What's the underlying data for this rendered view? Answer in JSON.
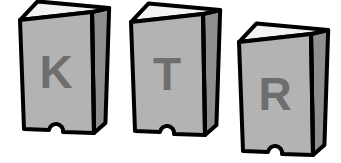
{
  "scene": {
    "title": "Three lettered blocks",
    "background_color": "#ffffff",
    "outline_color": "#000000",
    "top_face_color": "#f2f2f2",
    "front_face_color": "#b3b3b3",
    "side_face_color": "#8f8f8f",
    "letter_color": "#6e6e6e",
    "block_count": 3
  },
  "blocks": [
    {
      "label": "K",
      "name": "block-k",
      "order": 1,
      "x": 20,
      "y": 8,
      "front_width": 72,
      "front_height": 125,
      "depth": 22,
      "letter_x": 56,
      "letter_y": 88
    },
    {
      "label": "T",
      "name": "block-t",
      "order": 2,
      "x": 131,
      "y": 10,
      "front_width": 72,
      "front_height": 125,
      "depth": 22,
      "letter_x": 167,
      "letter_y": 90
    },
    {
      "label": "R",
      "name": "block-r",
      "order": 3,
      "x": 239,
      "y": 30,
      "front_width": 72,
      "front_height": 125,
      "depth": 22,
      "letter_x": 275,
      "letter_y": 110
    }
  ]
}
